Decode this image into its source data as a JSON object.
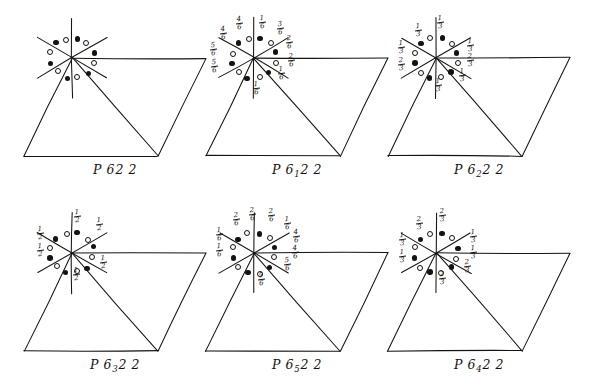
{
  "figure": {
    "type": "crystallographic-space-group-diagrams",
    "ink_color": "#16130f",
    "background": "#ffffff"
  },
  "diagrams": [
    {
      "id": "p622",
      "caption_main": "P 6",
      "caption_sub": "",
      "caption_tail": "2 2",
      "caption_plain": "P622",
      "labels": []
    },
    {
      "id": "p6122",
      "caption_main": "P 6",
      "caption_sub": "1",
      "caption_tail": "2 2",
      "caption_plain": "P6₁ 22",
      "labels": [
        {
          "num": "4",
          "den": "6",
          "x": 47,
          "y": 12
        },
        {
          "num": "1",
          "den": "6",
          "x": 70,
          "y": 11
        },
        {
          "num": "3",
          "den": "6",
          "x": 88,
          "y": 17
        },
        {
          "num": "4",
          "den": "6",
          "x": 31,
          "y": 22
        },
        {
          "num": "2",
          "den": "6",
          "x": 97,
          "y": 31
        },
        {
          "num": "5",
          "den": "6",
          "x": 21,
          "y": 38
        },
        {
          "num": "2",
          "den": "6",
          "x": 99,
          "y": 49
        },
        {
          "num": "5",
          "den": "6",
          "x": 22,
          "y": 55
        },
        {
          "num": "1",
          "den": "6",
          "x": 89,
          "y": 62
        },
        {
          "num": "1",
          "den": "6",
          "x": 64,
          "y": 77
        }
      ]
    },
    {
      "id": "p6222",
      "caption_main": "P 6",
      "caption_sub": "2",
      "caption_tail": "2 2",
      "caption_plain": "P6₂ 22",
      "labels": [
        {
          "num": "1",
          "den": "3",
          "x": 66,
          "y": 11
        },
        {
          "num": "1",
          "den": "3",
          "x": 44,
          "y": 19
        },
        {
          "num": "1",
          "den": "3",
          "x": 27,
          "y": 36
        },
        {
          "num": "2",
          "den": "3",
          "x": 27,
          "y": 53
        },
        {
          "num": "1",
          "den": "3",
          "x": 96,
          "y": 34
        },
        {
          "num": "2",
          "den": "3",
          "x": 96,
          "y": 49
        },
        {
          "num": "1",
          "den": "3",
          "x": 88,
          "y": 64
        },
        {
          "num": "1",
          "den": "3",
          "x": 64,
          "y": 74
        }
      ]
    },
    {
      "id": "p6322",
      "caption_main": "P 6",
      "caption_sub": "3",
      "caption_tail": "2 2",
      "caption_plain": "P6₃ 22",
      "labels": [
        {
          "num": "1",
          "den": "2",
          "x": 67,
          "y": 10
        },
        {
          "num": "1",
          "den": "2",
          "x": 89,
          "y": 18
        },
        {
          "num": "1",
          "den": "2",
          "x": 30,
          "y": 27
        },
        {
          "num": "1",
          "den": "2",
          "x": 30,
          "y": 44
        },
        {
          "num": "1",
          "den": "2",
          "x": 93,
          "y": 56
        },
        {
          "num": "1",
          "den": "2",
          "x": 66,
          "y": 68
        }
      ]
    },
    {
      "id": "p6522",
      "caption_main": "P 6",
      "caption_sub": "5",
      "caption_tail": "2 2",
      "caption_plain": "P6₅ 22",
      "labels": [
        {
          "num": "2",
          "den": "6",
          "x": 44,
          "y": 13
        },
        {
          "num": "2",
          "den": "6",
          "x": 60,
          "y": 8
        },
        {
          "num": "2",
          "den": "6",
          "x": 79,
          "y": 9
        },
        {
          "num": "1",
          "den": "6",
          "x": 95,
          "y": 17
        },
        {
          "num": "1",
          "den": "6",
          "x": 27,
          "y": 28
        },
        {
          "num": "4",
          "den": "6",
          "x": 104,
          "y": 30
        },
        {
          "num": "1",
          "den": "6",
          "x": 27,
          "y": 44
        },
        {
          "num": "4",
          "den": "6",
          "x": 103,
          "y": 46
        },
        {
          "num": "5",
          "den": "6",
          "x": 95,
          "y": 58
        },
        {
          "num": "5",
          "den": "6",
          "x": 69,
          "y": 73
        }
      ]
    },
    {
      "id": "p6422",
      "caption_main": "P 6",
      "caption_sub": "4",
      "caption_tail": "2 2",
      "caption_plain": "P6₄ 22",
      "labels": [
        {
          "num": "2",
          "den": "3",
          "x": 68,
          "y": 9
        },
        {
          "num": "2",
          "den": "3",
          "x": 45,
          "y": 17
        },
        {
          "num": "1",
          "den": "3",
          "x": 28,
          "y": 33
        },
        {
          "num": "1",
          "den": "3",
          "x": 28,
          "y": 50
        },
        {
          "num": "1",
          "den": "3",
          "x": 99,
          "y": 30
        },
        {
          "num": "1",
          "den": "3",
          "x": 99,
          "y": 46
        },
        {
          "num": "2",
          "den": "3",
          "x": 93,
          "y": 60
        },
        {
          "num": "2",
          "den": "3",
          "x": 68,
          "y": 72
        }
      ]
    }
  ],
  "symbols": {
    "filled_circle": "filled-circle",
    "open_circle": "open-circle",
    "ring_count": 12
  }
}
